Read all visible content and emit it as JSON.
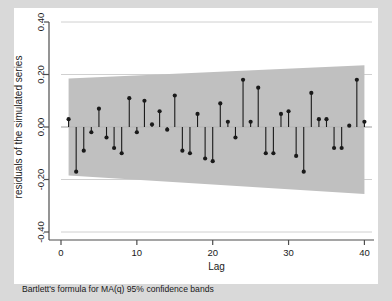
{
  "figure": {
    "background_color": "#d9d9d9",
    "plot_background_color": "#ffffff",
    "band_color": "#c0c0c0",
    "marker_color": "#1a1a1a",
    "gridline_color": "#d0d0d0",
    "axis_color": "#4d4d4d"
  },
  "chart_data": {
    "type": "scatter",
    "title": "",
    "subtitle": "",
    "xlabel": "Lag",
    "ylabel": "residuals of the simulated series",
    "note": "Bartlett's formula for MA(q) 95% confidence bands",
    "xlim": [
      0,
      41
    ],
    "ylim": [
      -0.4,
      0.4
    ],
    "xticks": [
      0,
      10,
      20,
      30,
      40
    ],
    "xticklabels": [
      "0",
      "10",
      "20",
      "30",
      "40"
    ],
    "yticks": [
      -0.4,
      -0.2,
      0.0,
      0.2,
      0.4
    ],
    "yticklabels": [
      "-0.40",
      "-0.20",
      "0.00",
      "0.20",
      "0.40"
    ],
    "grid": true,
    "grid_axis": "y",
    "legend": "none",
    "series": [
      {
        "name": "autocorrelations",
        "style": "stem-with-markers",
        "x": [
          1,
          2,
          3,
          4,
          5,
          6,
          7,
          8,
          9,
          10,
          11,
          12,
          13,
          14,
          15,
          16,
          17,
          18,
          19,
          20,
          21,
          22,
          23,
          24,
          25,
          26,
          27,
          28,
          29,
          30,
          31,
          32,
          33,
          34,
          35,
          36,
          37,
          38,
          39,
          40
        ],
        "values": [
          0.03,
          -0.17,
          -0.09,
          -0.02,
          0.07,
          -0.04,
          -0.08,
          -0.1,
          0.11,
          -0.02,
          0.1,
          0.01,
          0.06,
          -0.01,
          0.12,
          -0.09,
          -0.1,
          0.05,
          -0.12,
          -0.13,
          0.09,
          0.02,
          -0.04,
          0.18,
          0.02,
          0.15,
          -0.1,
          -0.1,
          0.05,
          0.06,
          -0.11,
          -0.17,
          0.13,
          0.03,
          0.03,
          -0.08,
          -0.08,
          0.005,
          0.18,
          0.02
        ]
      }
    ],
    "confidence_band": {
      "name": "Bartlett 95% confidence bands",
      "x": [
        1,
        40
      ],
      "upper": [
        0.185,
        0.235
      ],
      "lower": [
        -0.185,
        -0.255
      ],
      "fill_color": "#c0c0c0"
    }
  }
}
